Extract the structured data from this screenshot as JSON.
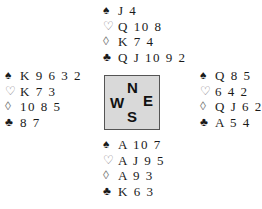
{
  "suit_symbols": {
    "spades": "♠",
    "hearts": "♡",
    "diamonds": "◊",
    "clubs": "♣"
  },
  "compass": {
    "north": "N",
    "west": "W",
    "east": "E",
    "south": "S"
  },
  "hands": {
    "north": {
      "spades": "J 4",
      "hearts": "Q 10 8",
      "diamonds": "K 7 4",
      "clubs": "Q J 10 9 2"
    },
    "west": {
      "spades": "K 9 6 3 2",
      "hearts": "K 7 3",
      "diamonds": "10 8 5",
      "clubs": "8 7"
    },
    "east": {
      "spades": "Q 8 5",
      "hearts": "6 4 2",
      "diamonds": "Q J 6 2",
      "clubs": "A 5 4"
    },
    "south": {
      "spades": "A 10 7",
      "hearts": "A J 9 5",
      "diamonds": "A 9 3",
      "clubs": "K 6 3"
    }
  }
}
